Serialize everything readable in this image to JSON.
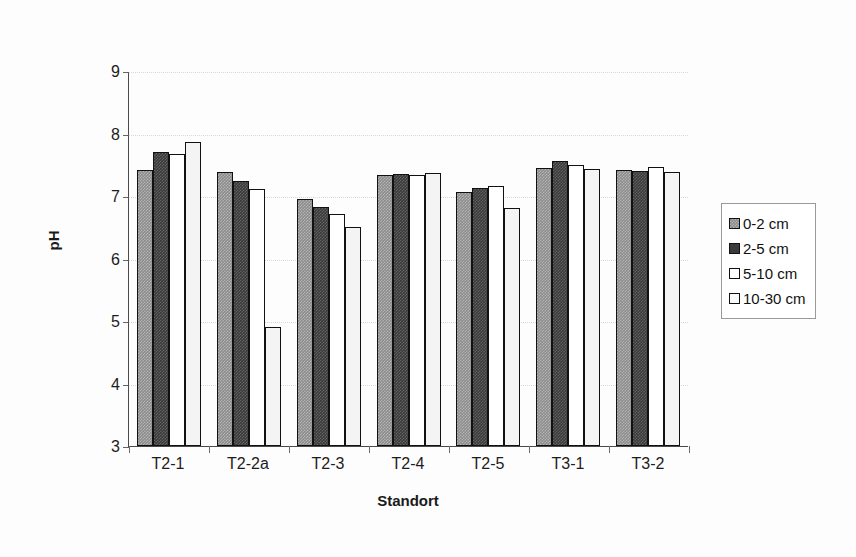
{
  "chart_data": {
    "type": "bar",
    "title": "",
    "xlabel": "Standort",
    "ylabel": "pH",
    "ylim": [
      3,
      9
    ],
    "yticks": [
      3,
      4,
      5,
      6,
      7,
      8,
      9
    ],
    "ytick_labels": [
      "3",
      "4",
      "5",
      "6",
      "7",
      "8",
      "9"
    ],
    "grid": true,
    "grid_axis": "y",
    "legend_position": "right",
    "categories": [
      "T2-1",
      "T2-2a",
      "T2-3",
      "T2-4",
      "T2-5",
      "T3-1",
      "T3-2"
    ],
    "series": [
      {
        "name": "0-2 cm",
        "color": "#8c8c8c",
        "values": [
          7.42,
          7.38,
          6.96,
          7.33,
          7.06,
          7.45,
          7.41
        ]
      },
      {
        "name": "2-5 cm",
        "color": "#3a3a3a",
        "values": [
          7.71,
          7.24,
          6.83,
          7.35,
          7.13,
          7.56,
          7.4
        ]
      },
      {
        "name": "5-10 cm",
        "color": "#ffffff",
        "values": [
          7.67,
          7.11,
          6.71,
          7.34,
          7.16,
          7.5,
          7.46
        ]
      },
      {
        "name": "10-30 cm",
        "color": "#f4f4f4",
        "values": [
          7.87,
          4.91,
          6.51,
          7.37,
          6.81,
          7.43,
          7.39
        ]
      }
    ]
  },
  "legend": {
    "items": [
      {
        "label": "0-2 cm"
      },
      {
        "label": "2-5 cm"
      },
      {
        "label": "5-10 cm"
      },
      {
        "label": "10-30 cm"
      }
    ]
  }
}
